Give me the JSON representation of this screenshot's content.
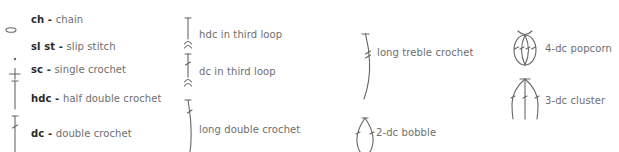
{
  "legend": {
    "column1": [
      {
        "abbr": "ch",
        "sep": " - ",
        "name": "chain",
        "icon": "oval-icon"
      },
      {
        "abbr": "sl st",
        "sep": " - ",
        "name": "slip stitch",
        "icon": "dot-icon"
      },
      {
        "abbr": "sc",
        "sep": " - ",
        "name": "single crochet",
        "icon": "plus-icon"
      },
      {
        "abbr": "hdc",
        "sep": " - ",
        "name": "half double crochet",
        "icon": "t-bar-icon"
      },
      {
        "abbr": "dc",
        "sep": " - ",
        "name": "double crochet",
        "icon": "t-bar-slash-icon"
      }
    ],
    "column2": [
      {
        "name": "hdc in third loop",
        "icon": "hdc-third-loop-icon"
      },
      {
        "name": "dc in third loop",
        "icon": "dc-third-loop-icon"
      },
      {
        "name": "long double crochet",
        "icon": "long-dc-icon"
      }
    ],
    "column3": [
      {
        "name": "long treble crochet",
        "icon": "long-treble-icon"
      },
      {
        "name": "2-dc bobble",
        "icon": "bobble-icon"
      }
    ],
    "column4": [
      {
        "name": "4-dc popcorn",
        "icon": "popcorn-icon"
      },
      {
        "name": "3-dc cluster",
        "icon": "cluster-icon"
      }
    ]
  },
  "colors": {
    "abbr": "#2a2a2a",
    "text": "#6e6e6e",
    "stroke": "#666666"
  }
}
